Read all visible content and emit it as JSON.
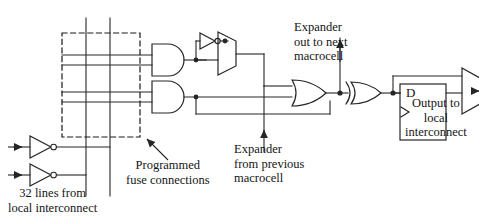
{
  "diagram": {
    "type": "logic-circuit-schematic",
    "background_color": "#ffffff",
    "line_color": "#262626",
    "dashed_box_color": "#1a1a1a",
    "text_color": "#151515"
  },
  "labels": {
    "expander_out": "Expander\nout to next\nmacrocell",
    "expander_in": "Expander\nfrom previous\nmacrocell",
    "programmed_fuse": "Programmed\nfuse connections",
    "input_lines": "32 lines from\nlocal interconnect",
    "output": "Output to\nlocal\ninterconnect",
    "flipflop_d": "D"
  },
  "components": {
    "and_gates": 2,
    "or_gates": 1,
    "xor_gates": 1,
    "inverters": 3,
    "muxes": 2,
    "flip_flops": 1,
    "input_arrows": 2,
    "vertical_product_term_lines": 2,
    "horizontal_input_lines": 4,
    "fuse_dots": 0
  },
  "callouts": {
    "expander_out_arrow": "up",
    "expander_in_arrow": "up",
    "fuse_arrow": "up-right",
    "output_arrow": "right"
  }
}
